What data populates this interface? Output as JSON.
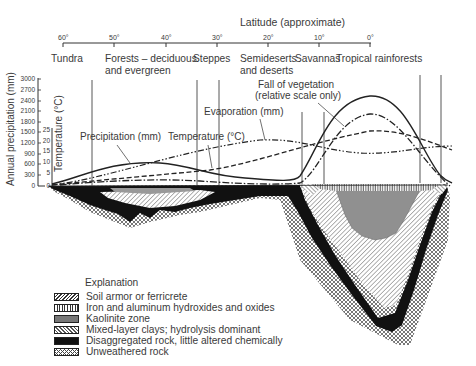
{
  "header": {
    "axis_title": "Latitude (approximate)",
    "latitude_ticks": [
      "60°",
      "50°",
      "40°",
      "30°",
      "20°",
      "10°",
      "0°"
    ]
  },
  "zones": [
    {
      "label": "Tundra",
      "label2": ""
    },
    {
      "label": "Forests – deciduous",
      "label2": "and evergreen"
    },
    {
      "label": "Steppes",
      "label2": ""
    },
    {
      "label": "Semideserts",
      "label2": "and deserts"
    },
    {
      "label": "Savannas",
      "label2": ""
    },
    {
      "label": "Tropical rainforests",
      "label2": ""
    }
  ],
  "axes": {
    "precip_label": "Annual precipitation (mm)",
    "precip_ticks": [
      "3000",
      "2700",
      "2400",
      "2100",
      "1800",
      "1500",
      "1200",
      "900",
      "600",
      "300",
      "0"
    ],
    "temp_label": "Temperature (°C)",
    "temp_ticks": [
      "25",
      "20",
      "15",
      "10",
      "5",
      "0"
    ]
  },
  "annotations": {
    "precipitation": "Precipitation (mm)",
    "temperature": "Temperature (°C)",
    "evaporation": "Evaporation (mm)",
    "vegetation_1": "Fall of vegetation",
    "vegetation_2": "(relative scale only)"
  },
  "legend": {
    "title": "Explanation",
    "items": [
      {
        "label": "Soil armor or ferricrete"
      },
      {
        "label": "Iron and aluminum hydroxides and oxides"
      },
      {
        "label": "Kaolinite zone"
      },
      {
        "label": "Mixed-layer clays; hydrolysis dominant"
      },
      {
        "label": "Disaggregated rock, little altered chemically"
      },
      {
        "label": "Unweathered rock"
      }
    ]
  }
}
